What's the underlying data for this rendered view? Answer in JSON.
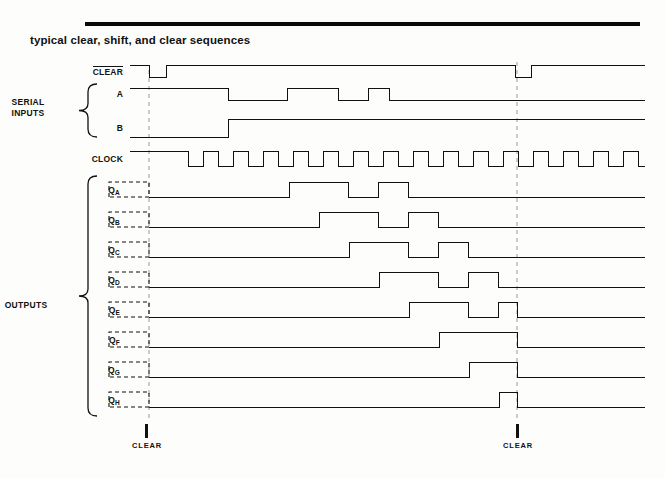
{
  "page": {
    "title": "typical clear, shift, and clear sequences",
    "background": "#fdfdfb",
    "ink": "#111111",
    "rule_color": "#0a0a0a"
  },
  "groups": [
    {
      "name": "serial-inputs",
      "label_line1": "SERIAL",
      "label_line2": "INPUTS",
      "x": 28,
      "y": 97,
      "brace_top": 84,
      "brace_bottom": 137
    },
    {
      "name": "outputs",
      "label_line1": "OUTPUTS",
      "label_line2": "",
      "x": 26,
      "y": 300,
      "brace_top": 176,
      "brace_bottom": 416
    }
  ],
  "signals": [
    {
      "name": "clear-input",
      "label": "CLEAR",
      "overbar": true,
      "label_x": 123,
      "y_high": 65,
      "y_low": 77,
      "start_level": 1,
      "edges": [
        [
          149,
          0
        ],
        [
          166,
          1
        ],
        [
          515,
          0
        ],
        [
          531,
          1
        ]
      ],
      "dashed_unknown": null
    },
    {
      "name": "serial-a",
      "label": "A",
      "overbar": false,
      "label_x": 123,
      "y_high": 88,
      "y_low": 100,
      "start_level": 1,
      "edges": [
        [
          228,
          0
        ],
        [
          287,
          1
        ],
        [
          338,
          0
        ],
        [
          368,
          1
        ],
        [
          389,
          0
        ]
      ],
      "dashed_unknown": null
    },
    {
      "name": "serial-b",
      "label": "B",
      "overbar": false,
      "label_x": 123,
      "y_high": 119,
      "y_low": 137,
      "start_level": 0,
      "edges": [
        [
          228,
          1
        ]
      ],
      "dashed_unknown": null
    },
    {
      "name": "clock",
      "label": "CLOCK",
      "overbar": false,
      "label_x": 123,
      "y_high": 151,
      "y_low": 166,
      "start_level": 1,
      "edges": [
        [
          188,
          0
        ],
        [
          203,
          1
        ],
        [
          218,
          0
        ],
        [
          233,
          1
        ],
        [
          248,
          0
        ],
        [
          263,
          1
        ],
        [
          278,
          0
        ],
        [
          293,
          1
        ],
        [
          308,
          0
        ],
        [
          323,
          1
        ],
        [
          338,
          0
        ],
        [
          353,
          1
        ],
        [
          368,
          0
        ],
        [
          383,
          1
        ],
        [
          398,
          0
        ],
        [
          413,
          1
        ],
        [
          428,
          0
        ],
        [
          443,
          1
        ],
        [
          458,
          0
        ],
        [
          473,
          1
        ],
        [
          488,
          0
        ],
        [
          503,
          1
        ],
        [
          518,
          0
        ],
        [
          533,
          1
        ],
        [
          548,
          0
        ],
        [
          563,
          1
        ],
        [
          578,
          0
        ],
        [
          593,
          1
        ],
        [
          608,
          0
        ],
        [
          623,
          1
        ],
        [
          638,
          0
        ]
      ],
      "dashed_unknown": null
    },
    {
      "name": "output-qa",
      "label": "Q<sub>A</sub>",
      "overbar": false,
      "label_x": 120,
      "y_high": 182,
      "y_low": 197,
      "start_level": 0,
      "edges": [
        [
          289,
          1
        ],
        [
          348,
          0
        ],
        [
          378,
          1
        ],
        [
          408,
          0
        ]
      ],
      "dashed_unknown": {
        "x1": 109,
        "x2": 149
      }
    },
    {
      "name": "output-qb",
      "label": "Q<sub>B</sub>",
      "overbar": false,
      "label_x": 120,
      "y_high": 212,
      "y_low": 227,
      "start_level": 0,
      "edges": [
        [
          319,
          1
        ],
        [
          378,
          0
        ],
        [
          408,
          1
        ],
        [
          438,
          0
        ]
      ],
      "dashed_unknown": {
        "x1": 109,
        "x2": 149
      }
    },
    {
      "name": "output-qc",
      "label": "Q<sub>C</sub>",
      "overbar": false,
      "label_x": 120,
      "y_high": 242,
      "y_low": 257,
      "start_level": 0,
      "edges": [
        [
          349,
          1
        ],
        [
          408,
          0
        ],
        [
          438,
          1
        ],
        [
          468,
          0
        ]
      ],
      "dashed_unknown": {
        "x1": 109,
        "x2": 149
      }
    },
    {
      "name": "output-qd",
      "label": "Q<sub>D</sub>",
      "overbar": false,
      "label_x": 120,
      "y_high": 272,
      "y_low": 287,
      "start_level": 0,
      "edges": [
        [
          379,
          1
        ],
        [
          438,
          0
        ],
        [
          468,
          1
        ],
        [
          498,
          0
        ]
      ],
      "dashed_unknown": {
        "x1": 109,
        "x2": 149
      }
    },
    {
      "name": "output-qe",
      "label": "Q<sub>E</sub>",
      "overbar": false,
      "label_x": 120,
      "y_high": 302,
      "y_low": 317,
      "start_level": 0,
      "edges": [
        [
          409,
          1
        ],
        [
          468,
          0
        ],
        [
          498,
          1
        ],
        [
          517,
          0
        ]
      ],
      "dashed_unknown": {
        "x1": 109,
        "x2": 149
      }
    },
    {
      "name": "output-qf",
      "label": "Q<sub>F</sub>",
      "overbar": false,
      "label_x": 120,
      "y_high": 332,
      "y_low": 347,
      "start_level": 0,
      "edges": [
        [
          439,
          1
        ],
        [
          517,
          0
        ]
      ],
      "dashed_unknown": {
        "x1": 109,
        "x2": 149
      }
    },
    {
      "name": "output-qg",
      "label": "Q<sub>G</sub>",
      "overbar": false,
      "label_x": 120,
      "y_high": 362,
      "y_low": 377,
      "start_level": 0,
      "edges": [
        [
          469,
          1
        ],
        [
          517,
          0
        ]
      ],
      "dashed_unknown": {
        "x1": 109,
        "x2": 149
      }
    },
    {
      "name": "output-qh",
      "label": "Q<sub>H</sub>",
      "overbar": false,
      "label_x": 120,
      "y_high": 392,
      "y_low": 407,
      "start_level": 0,
      "edges": [
        [
          499,
          1
        ],
        [
          517,
          0
        ]
      ],
      "dashed_unknown": {
        "x1": 109,
        "x2": 149
      }
    }
  ],
  "reference_lines": [
    {
      "name": "clear-ref-1",
      "x": 149,
      "y1": 70,
      "y2": 420
    },
    {
      "name": "clear-ref-2",
      "x": 517,
      "y1": 62,
      "y2": 420
    }
  ],
  "markers": [
    {
      "name": "clear-marker-1",
      "label": "CLEAR",
      "x": 146,
      "tick_y": 424,
      "tick_h": 14,
      "label_y": 441
    },
    {
      "name": "clear-marker-2",
      "label": "CLEAR",
      "x": 517,
      "tick_y": 424,
      "tick_h": 14,
      "label_y": 441
    }
  ],
  "waveform_geometry": {
    "x_start": 130,
    "x_end": 645,
    "clock_period": 30,
    "line_width": 1
  }
}
